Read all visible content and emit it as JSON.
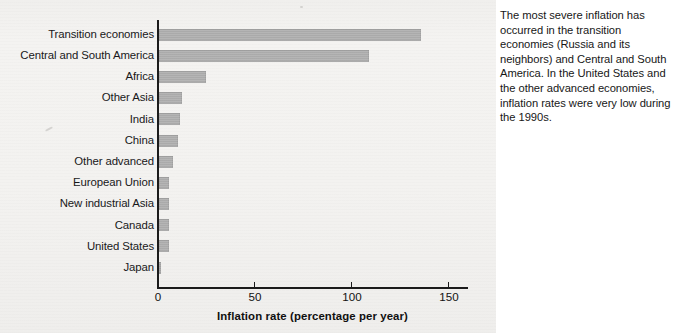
{
  "figure": {
    "caption": "The most severe inflation has occurred in the transition economies (Russia and its neighbors) and Central and South America. In the United States and the other advanced economies, inflation rates were very low during the 1990s."
  },
  "chart_data": {
    "type": "bar",
    "orientation": "horizontal",
    "title": "",
    "xlabel": "Inflation rate (percentage per year)",
    "ylabel": "",
    "xlim": [
      0,
      160
    ],
    "xticks": [
      0,
      50,
      100,
      150
    ],
    "xtick_labels": [
      "0",
      "50",
      "100",
      "150"
    ],
    "grid": false,
    "legend": false,
    "bar_color": "#adadad",
    "categories": [
      "Transition economies",
      "Central and South America",
      "Africa",
      "Other Asia",
      "India",
      "China",
      "Other advanced",
      "European Union",
      "New industrial Asia",
      "Canada",
      "United States",
      "Japan"
    ],
    "values": [
      135,
      108,
      24,
      12,
      11,
      10,
      7,
      5,
      5,
      5,
      5,
      1
    ]
  }
}
